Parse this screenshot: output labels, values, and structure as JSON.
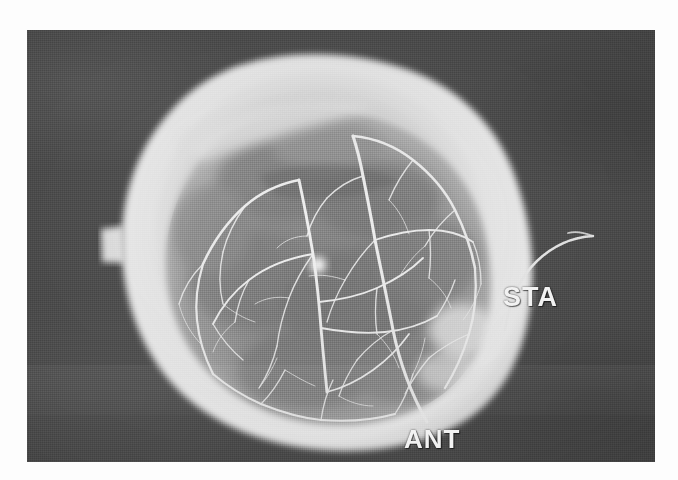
{
  "image": {
    "modality": "angiogram",
    "view_orientation": "lateral skull",
    "frame": {
      "x": 27,
      "y": 30,
      "width": 628,
      "height": 432
    },
    "background_color": "#4e4e4e",
    "page_color": "#ffffff",
    "skull_rim_color": "#ededed",
    "brain_field_color": "#8a8a8a",
    "vessel_color": "#f2f2f2"
  },
  "annotations": {
    "sta": {
      "label": "STA",
      "full_name": "superficial temporal artery",
      "x": 505,
      "y": 288
    },
    "ant": {
      "label": "ANT",
      "full_name": "anterior",
      "x": 405,
      "y": 428
    }
  },
  "features": {
    "catheter_marker": "curved-wire-arc",
    "focal_bright_spot": "vessel-node",
    "vascular_network": "branching-arterial-tree"
  }
}
